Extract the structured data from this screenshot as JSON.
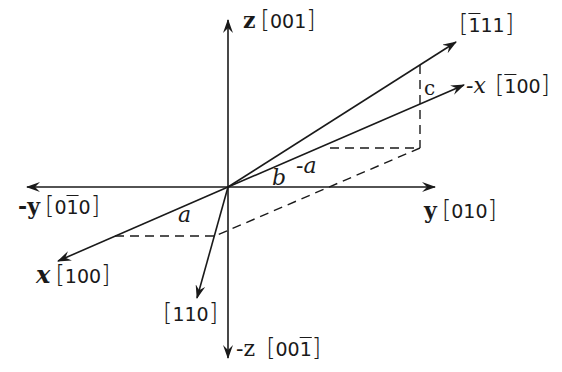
{
  "diagram": {
    "type": "crystallographic-axes",
    "stroke_color": "#1a1a1a",
    "background": "#ffffff",
    "origin": [
      228,
      187
    ],
    "axes": [
      {
        "id": "z",
        "symbol": "z",
        "indices": [
          "0",
          "0",
          "1"
        ],
        "bars": [
          false,
          false,
          false
        ]
      },
      {
        "id": "neg-z",
        "symbol": "-z",
        "indices": [
          "0",
          "0",
          "1"
        ],
        "bars": [
          false,
          false,
          true
        ]
      },
      {
        "id": "y",
        "symbol": "y",
        "indices": [
          "0",
          "1",
          "0"
        ],
        "bars": [
          false,
          false,
          false
        ]
      },
      {
        "id": "neg-y",
        "symbol": "-y",
        "indices": [
          "0",
          "1",
          "0"
        ],
        "bars": [
          false,
          true,
          false
        ]
      },
      {
        "id": "x",
        "symbol": "x",
        "indices": [
          "1",
          "0",
          "0"
        ],
        "bars": [
          false,
          false,
          false
        ]
      },
      {
        "id": "neg-x",
        "symbol": "-x",
        "indices": [
          "1",
          "0",
          "0"
        ],
        "bars": [
          true,
          false,
          false
        ]
      },
      {
        "id": "dir-111",
        "symbol": "",
        "indices": [
          "1",
          "1",
          "1"
        ],
        "bars": [
          true,
          false,
          false
        ]
      },
      {
        "id": "dir-110",
        "symbol": "",
        "indices": [
          "1",
          "1",
          "0"
        ],
        "bars": [
          false,
          false,
          false
        ]
      }
    ],
    "angle_labels": {
      "a_left": "a",
      "neg_a": "-a",
      "b": "b",
      "c": "c"
    }
  }
}
